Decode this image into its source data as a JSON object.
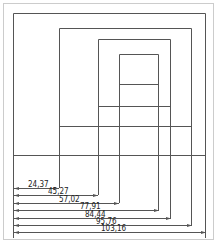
{
  "diagram": {
    "dimensions": [
      {
        "label": "24,37",
        "x_end": 59,
        "y": 188,
        "label_x": 28
      },
      {
        "label": "45,27",
        "x_end": 98,
        "y": 195,
        "label_x": 48
      },
      {
        "label": "57,02",
        "x_end": 119,
        "y": 203,
        "label_x": 59
      },
      {
        "label": "77,91",
        "x_end": 159,
        "y": 210,
        "label_x": 80
      },
      {
        "label": "84,44",
        "x_end": 171,
        "y": 218,
        "label_x": 85
      },
      {
        "label": "95,76",
        "x_end": 192,
        "y": 225,
        "label_x": 96
      },
      {
        "label": "103,16",
        "x_end": 206,
        "y": 232,
        "label_x": 101
      }
    ],
    "colors": {
      "line": "#555555",
      "frame": "#cccccc",
      "text": "#222222"
    }
  }
}
